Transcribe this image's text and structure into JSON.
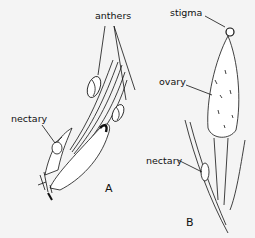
{
  "figure": {
    "panels": [
      {
        "id": "A",
        "label": "A",
        "parts": [
          "anthers",
          "nectary"
        ]
      },
      {
        "id": "B",
        "label": "B",
        "parts": [
          "stigma",
          "ovary",
          "nectary"
        ]
      }
    ]
  },
  "labels": {
    "a_anthers": "anthers",
    "a_nectary": "nectary",
    "panel_a": "A",
    "b_stigma": "stigma",
    "b_ovary": "ovary",
    "b_nectary": "nectary",
    "panel_b": "B"
  }
}
